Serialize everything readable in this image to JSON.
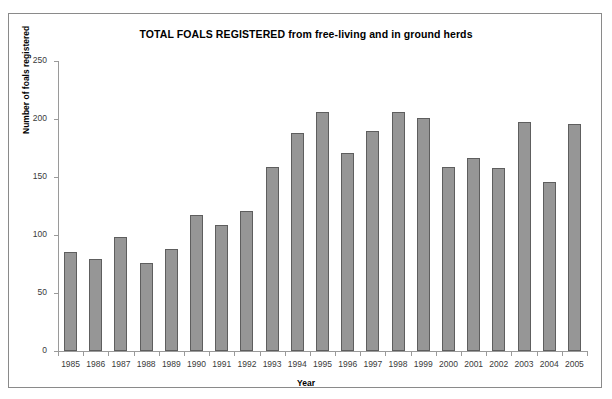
{
  "chart_data": {
    "type": "bar",
    "title": "TOTAL FOALS REGISTERED from free-living and in ground herds",
    "xlabel": "Year",
    "ylabel": "Number of foals registered",
    "categories": [
      "1985",
      "1986",
      "1987",
      "1988",
      "1989",
      "1990",
      "1991",
      "1992",
      "1993",
      "1994",
      "1995",
      "1996",
      "1997",
      "1998",
      "1999",
      "2000",
      "2001",
      "2002",
      "2003",
      "2004",
      "2005"
    ],
    "values": [
      85,
      79,
      98,
      76,
      88,
      117,
      109,
      121,
      159,
      188,
      206,
      171,
      190,
      206,
      201,
      159,
      166,
      158,
      197,
      146,
      196
    ],
    "ylim": [
      0,
      250
    ],
    "yticks": [
      0,
      50,
      100,
      150,
      200,
      250
    ],
    "ytick_labels": [
      "0",
      "50",
      "100",
      "150",
      "200",
      "250"
    ],
    "grid": false,
    "legend": null,
    "series": [
      {
        "name": "Total foals registered",
        "values": [
          85,
          79,
          98,
          76,
          88,
          117,
          109,
          121,
          159,
          188,
          206,
          171,
          190,
          206,
          201,
          159,
          166,
          158,
          197,
          146,
          196
        ]
      }
    ],
    "colors": {
      "bar_fill": "#969696",
      "bar_border": "#5e5e5e",
      "axis": "#9a9a9a",
      "text": "#000000",
      "frame_border": "#8a8a8a",
      "background": "#ffffff"
    }
  }
}
